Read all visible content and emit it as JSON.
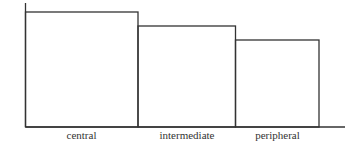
{
  "chart_data": {
    "type": "bar",
    "title": "",
    "xlabel": "",
    "ylabel": "",
    "categories": [
      "central",
      "intermediate",
      "peripheral"
    ],
    "values": [
      115,
      101,
      87
    ],
    "value_units": "relative (no y-axis scale shown)",
    "grid": false,
    "legend": "none",
    "colors": {
      "stroke": "#333333",
      "fill": "#ffffff"
    }
  }
}
